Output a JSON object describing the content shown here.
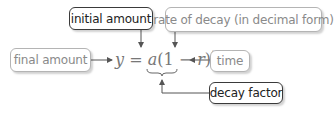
{
  "labels": {
    "initial_amount": "initial amount",
    "rate_of_decay": "rate of decay (in decimal form)",
    "final_amount": "final amount",
    "time": "time",
    "decay_factor": "decay factor"
  },
  "equation": {
    "y": "y",
    "equals": " = ",
    "a": "a",
    "open": "(1 − ",
    "r": "r",
    "close": ")",
    "t": "t"
  },
  "colors": {
    "dark_border": "#3a3a3a",
    "light_border": "#b4b4b4",
    "light_text": "#8a8a8a",
    "arrow": "#555555"
  }
}
